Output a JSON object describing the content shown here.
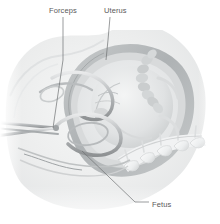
{
  "figure": {
    "type": "medical-illustration",
    "style": "greyscale-airbrush",
    "background_color": "#ffffff",
    "width": 220,
    "height": 224
  },
  "labels": [
    {
      "id": "forceps",
      "text": "Forceps",
      "text_color": "#5a5a5a",
      "x": 49,
      "y": 6,
      "leader_from": [
        63,
        17
      ],
      "leader_to": [
        53,
        128
      ]
    },
    {
      "id": "uterus",
      "text": "Uterus",
      "text_color": "#5a5a5a",
      "x": 104,
      "y": 6,
      "leader_from": [
        110,
        17
      ],
      "leader_to": [
        106,
        60
      ]
    },
    {
      "id": "fetus",
      "text": "Fetus",
      "text_color": "#5a5a5a",
      "x": 152,
      "y": 200,
      "leader_from": [
        82,
        151
      ],
      "leader_to": [
        149,
        206
      ]
    }
  ],
  "anatomy": {
    "maternal_body": {
      "name": "maternal abdomen and pelvis",
      "fill": "#ececed"
    },
    "uterus": {
      "name": "uterine wall",
      "fill": "#b9bcbd"
    },
    "amniotic_cavity": {
      "name": "amniotic cavity",
      "fill": "#e4e6e7"
    },
    "fetus": {
      "name": "fetus in vertex presentation",
      "fill": "#dedfe0"
    },
    "fetal_spine": {
      "name": "fetal vertebral column",
      "fill": "#d2d4d5"
    },
    "sacrum": {
      "name": "maternal sacrum and lumbar vertebrae",
      "fill": "#f2f3f4"
    },
    "forceps": {
      "name": "obstetric forceps",
      "fill": "#c9ccce",
      "description": "paired blades cupping the fetal head with shanks and handles extending left"
    }
  },
  "palette": {
    "line_dark": "#8e9194",
    "line_mid": "#b4b7b9",
    "line_light": "#d6d8d9",
    "tissue_light": "#eef0f0",
    "tissue_mid": "#dcdedf",
    "tissue_dark": "#b2b5b7",
    "leader_line": "#6f7173"
  }
}
